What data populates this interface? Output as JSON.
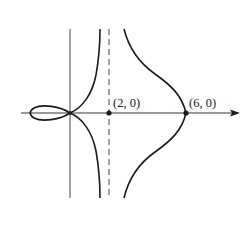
{
  "figure": {
    "points": [
      {
        "id": "asymptote-point",
        "label": "(2, 0)",
        "x": 2,
        "y": 0
      },
      {
        "id": "vertex-point",
        "label": "(6, 0)",
        "x": 6,
        "y": 0
      }
    ],
    "asymptote": {
      "type": "vertical",
      "x": 2,
      "style": "dashed"
    },
    "colors": {
      "curve": "#1a1a1a",
      "axis": "#333333",
      "background": "#ffffff"
    }
  }
}
